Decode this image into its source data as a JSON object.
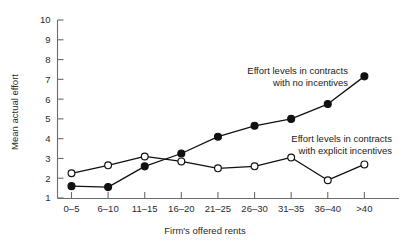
{
  "chart_data": {
    "type": "line",
    "title": "",
    "xlabel": "Firm's offered rents",
    "ylabel": "Mean actual effort",
    "categories": [
      "0–5",
      "6–10",
      "11–15",
      "16–20",
      "21–25",
      "26–30",
      "31–35",
      "36–40",
      ">40"
    ],
    "ylim": [
      1,
      10
    ],
    "yticks": [
      1,
      2,
      3,
      4,
      5,
      6,
      7,
      8,
      9,
      10
    ],
    "ytick_labels": [
      "1",
      "2",
      "3",
      "4",
      "5",
      "6",
      "7",
      "8",
      "9",
      "10"
    ],
    "grid": false,
    "legend_position": "inline-annotations",
    "series": [
      {
        "name": "Effort levels in contracts with no incentives",
        "marker": "filled-circle",
        "values": [
          1.6,
          1.55,
          2.6,
          3.25,
          4.1,
          4.65,
          5.0,
          5.75,
          7.15
        ]
      },
      {
        "name": "Effort levels in contracts with explicit incentives",
        "marker": "open-circle",
        "values": [
          2.25,
          2.65,
          3.1,
          2.85,
          2.5,
          2.6,
          3.05,
          1.9,
          2.7
        ]
      }
    ],
    "annotations": [
      {
        "id": "no-incentives",
        "line1": "Effort levels in contracts",
        "line2": "with no incentives"
      },
      {
        "id": "explicit-incentives",
        "line1": "Effort levels in contracts",
        "line2": "with explicit incentives"
      }
    ],
    "colors": {
      "line": "#111111",
      "axis": "#6b6b6b",
      "background": "#ffffff",
      "marker_fill_open": "#ffffff",
      "marker_fill_closed": "#111111"
    }
  }
}
